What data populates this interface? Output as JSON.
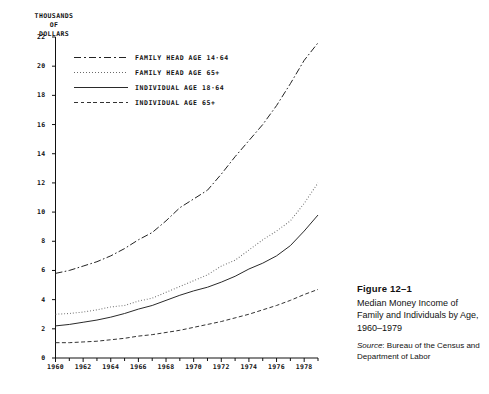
{
  "chart_data": {
    "type": "line",
    "title": "Median Money Income of Family and Individuals by Age, 1960–1979",
    "figure_number": "Figure  12–1",
    "source_label": "Source",
    "source_text": ": Bureau of the Census and Department of Labor",
    "ylabel_lines": [
      "THOUSANDS",
      "OF",
      "DOLLARS"
    ],
    "xlabel": "",
    "ylim": [
      0,
      22
    ],
    "xlim": [
      1960,
      1979
    ],
    "ytick_values": [
      0,
      2,
      4,
      6,
      8,
      10,
      12,
      14,
      16,
      18,
      20,
      22
    ],
    "ytick_labels": [
      "0",
      "2",
      "4",
      "6",
      "8",
      "10",
      "12",
      "14",
      "16",
      "18",
      "20",
      "22"
    ],
    "xtick_values": [
      1960,
      1962,
      1964,
      1966,
      1968,
      1970,
      1972,
      1974,
      1976,
      1978
    ],
    "xtick_labels": [
      "1960",
      "1962",
      "1964",
      "1966",
      "1968",
      "1970",
      "1972",
      "1974",
      "1976",
      "1978"
    ],
    "x": [
      1960,
      1961,
      1962,
      1963,
      1964,
      1965,
      1966,
      1967,
      1968,
      1969,
      1970,
      1971,
      1972,
      1973,
      1974,
      1975,
      1976,
      1977,
      1978,
      1979
    ],
    "grid": false,
    "legend_position": "upper-left",
    "series": [
      {
        "name": "FAMILY  HEAD  AGE  14·64",
        "key": "family-head-14-64",
        "style": "dashdot",
        "color": "#222222",
        "values": [
          5.8,
          6.0,
          6.3,
          6.6,
          7.0,
          7.5,
          8.1,
          8.6,
          9.4,
          10.3,
          10.9,
          11.5,
          12.6,
          13.8,
          14.9,
          16.0,
          17.3,
          18.8,
          20.4,
          21.6
        ]
      },
      {
        "name": "FAMILY  HEAD  AGE  65+",
        "key": "family-head-65-plus",
        "style": "dotted",
        "color": "#6a6a6a",
        "values": [
          3.0,
          3.05,
          3.15,
          3.3,
          3.5,
          3.6,
          3.9,
          4.1,
          4.5,
          4.9,
          5.3,
          5.7,
          6.3,
          6.7,
          7.4,
          8.1,
          8.7,
          9.4,
          10.6,
          12.0
        ]
      },
      {
        "name": "INDIVIDUAL  AGE  18·64",
        "key": "individual-18-64",
        "style": "solid",
        "color": "#2a2a2a",
        "values": [
          2.2,
          2.3,
          2.45,
          2.6,
          2.8,
          3.05,
          3.35,
          3.6,
          3.95,
          4.3,
          4.6,
          4.85,
          5.2,
          5.6,
          6.1,
          6.5,
          7.0,
          7.7,
          8.7,
          9.8
        ]
      },
      {
        "name": "INDIVIDUAL  AGE  65+",
        "key": "individual-65-plus",
        "style": "dashed",
        "color": "#333333",
        "values": [
          1.05,
          1.05,
          1.1,
          1.15,
          1.25,
          1.35,
          1.5,
          1.6,
          1.75,
          1.9,
          2.1,
          2.3,
          2.5,
          2.75,
          3.0,
          3.3,
          3.6,
          3.95,
          4.35,
          4.7
        ]
      }
    ]
  }
}
